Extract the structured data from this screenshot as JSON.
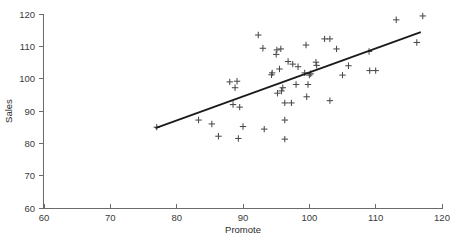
{
  "chart_data": {
    "type": "scatter",
    "title": "",
    "xlabel": "Promote",
    "ylabel": "Sales",
    "xlim": [
      60,
      120
    ],
    "ylim": [
      60,
      120
    ],
    "xticks": [
      60,
      70,
      80,
      90,
      100,
      110,
      120
    ],
    "yticks": [
      60,
      70,
      80,
      90,
      100,
      110,
      120
    ],
    "grid": false,
    "legend": "none",
    "marker": "plus",
    "marker_color": "#4a4a4a",
    "line_color": "#1a1a1a",
    "axis_color": "#6b6b6b",
    "background": "#ffffff",
    "points": [
      {
        "x": 77.0,
        "y": 85.0
      },
      {
        "x": 83.3,
        "y": 87.2
      },
      {
        "x": 85.3,
        "y": 86.0
      },
      {
        "x": 86.3,
        "y": 82.2
      },
      {
        "x": 88.0,
        "y": 99.0
      },
      {
        "x": 88.5,
        "y": 92.0
      },
      {
        "x": 88.8,
        "y": 97.2
      },
      {
        "x": 89.1,
        "y": 99.2
      },
      {
        "x": 89.3,
        "y": 81.5
      },
      {
        "x": 89.5,
        "y": 91.2
      },
      {
        "x": 90.0,
        "y": 85.2
      },
      {
        "x": 92.3,
        "y": 113.5
      },
      {
        "x": 93.0,
        "y": 109.4
      },
      {
        "x": 93.2,
        "y": 84.4
      },
      {
        "x": 94.3,
        "y": 101.2
      },
      {
        "x": 94.4,
        "y": 101.8
      },
      {
        "x": 95.0,
        "y": 107.5
      },
      {
        "x": 95.1,
        "y": 108.9
      },
      {
        "x": 95.2,
        "y": 95.5
      },
      {
        "x": 95.5,
        "y": 103.0
      },
      {
        "x": 95.7,
        "y": 109.2
      },
      {
        "x": 95.8,
        "y": 96.2
      },
      {
        "x": 96.0,
        "y": 97.2
      },
      {
        "x": 96.3,
        "y": 92.5
      },
      {
        "x": 96.3,
        "y": 87.2
      },
      {
        "x": 96.3,
        "y": 81.3
      },
      {
        "x": 96.8,
        "y": 105.3
      },
      {
        "x": 97.3,
        "y": 92.5
      },
      {
        "x": 97.5,
        "y": 104.5
      },
      {
        "x": 98.0,
        "y": 98.2
      },
      {
        "x": 98.3,
        "y": 103.7
      },
      {
        "x": 99.3,
        "y": 101.8
      },
      {
        "x": 99.5,
        "y": 110.4
      },
      {
        "x": 99.6,
        "y": 94.4
      },
      {
        "x": 99.8,
        "y": 98.2
      },
      {
        "x": 100.0,
        "y": 101.1
      },
      {
        "x": 100.2,
        "y": 101.5
      },
      {
        "x": 101.0,
        "y": 105.1
      },
      {
        "x": 101.1,
        "y": 104.1
      },
      {
        "x": 102.3,
        "y": 112.3
      },
      {
        "x": 103.1,
        "y": 112.3
      },
      {
        "x": 103.1,
        "y": 93.2
      },
      {
        "x": 104.1,
        "y": 109.2
      },
      {
        "x": 105.0,
        "y": 101.1
      },
      {
        "x": 105.9,
        "y": 104.0
      },
      {
        "x": 109.0,
        "y": 108.4
      },
      {
        "x": 109.1,
        "y": 102.5
      },
      {
        "x": 110.0,
        "y": 102.5
      },
      {
        "x": 113.1,
        "y": 118.2
      },
      {
        "x": 116.2,
        "y": 111.2
      },
      {
        "x": 117.1,
        "y": 119.4
      }
    ],
    "fit_line": {
      "x0": 76.8,
      "y0": 84.7,
      "x1": 116.8,
      "y1": 114.4
    }
  }
}
